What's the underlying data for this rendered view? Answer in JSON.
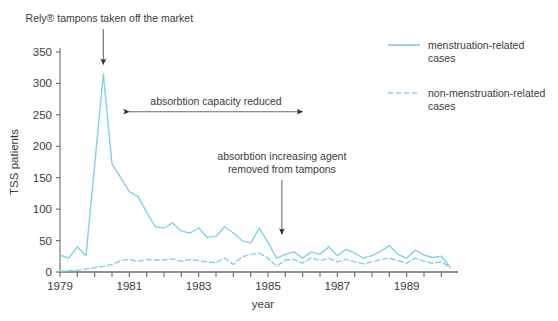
{
  "chart_data": {
    "type": "line",
    "title": "",
    "xlabel": "year",
    "ylabel": "TSS patients",
    "xlim": [
      1979.0,
      1990.25
    ],
    "ylim": [
      0,
      350
    ],
    "yticks": [
      0,
      50,
      100,
      150,
      200,
      250,
      300,
      350
    ],
    "ytick_labels": [
      "0",
      "50",
      "100",
      "150",
      "200",
      "250",
      "300",
      "350"
    ],
    "xticks": [
      1979,
      1979.5,
      1980,
      1980.5,
      1981,
      1981.5,
      1982,
      1982.5,
      1983,
      1983.5,
      1984,
      1984.5,
      1985,
      1985.5,
      1986,
      1986.5,
      1987,
      1987.5,
      1988,
      1988.5,
      1989,
      1989.5,
      1990
    ],
    "xtick_labels_shown": [
      "1979",
      "1981",
      "1983",
      "1985",
      "1987",
      "1989"
    ],
    "xtick_labels_values": [
      1979,
      1981,
      1983,
      1985,
      1987,
      1989
    ],
    "grid": false,
    "legend_position": "top-right",
    "x": [
      1979.0,
      1979.25,
      1979.5,
      1979.75,
      1980.0,
      1980.25,
      1980.5,
      1980.75,
      1981.0,
      1981.25,
      1981.5,
      1981.75,
      1982.0,
      1982.25,
      1982.5,
      1982.75,
      1983.0,
      1983.25,
      1983.5,
      1983.75,
      1984.0,
      1984.25,
      1984.5,
      1984.75,
      1985.0,
      1985.25,
      1985.5,
      1985.75,
      1986.0,
      1986.25,
      1986.5,
      1986.75,
      1987.0,
      1987.25,
      1987.5,
      1987.75,
      1988.0,
      1988.25,
      1988.5,
      1988.75,
      1989.0,
      1989.25,
      1989.5,
      1989.75,
      1990.0,
      1990.25
    ],
    "series": [
      {
        "name": "menstruation-related cases",
        "style": "solid",
        "color": "#7FD2E8",
        "values": [
          27,
          22,
          40,
          26,
          170,
          315,
          172,
          150,
          128,
          120,
          95,
          72,
          70,
          78,
          65,
          62,
          70,
          55,
          57,
          72,
          62,
          50,
          46,
          70,
          47,
          22,
          28,
          32,
          22,
          32,
          28,
          40,
          26,
          36,
          30,
          22,
          26,
          33,
          42,
          28,
          22,
          35,
          27,
          23,
          25,
          8
        ]
      },
      {
        "name": "non-menstruation-related cases",
        "style": "dashed",
        "color": "#7FD2E8",
        "values": [
          1,
          2,
          3,
          5,
          7,
          9,
          12,
          18,
          20,
          17,
          20,
          19,
          19,
          21,
          17,
          20,
          18,
          16,
          15,
          22,
          12,
          24,
          28,
          30,
          22,
          9,
          19,
          20,
          14,
          23,
          18,
          22,
          16,
          20,
          16,
          13,
          16,
          20,
          22,
          18,
          14,
          22,
          17,
          14,
          16,
          7
        ]
      }
    ],
    "annotations": [
      {
        "id": "rely-removed",
        "text": "Rely® tampons taken off the market",
        "arrow": "down",
        "target_x": 1980.25,
        "target_y": 330
      },
      {
        "id": "absorbtion-capacity-reduced",
        "text": "absorbtion capacity reduced",
        "arrow": "double",
        "from_x": 1981.0,
        "to_x": 1986.0,
        "y": 255
      },
      {
        "id": "absorbtion-agent-removed",
        "text_line1": "absorbtion increasing agent",
        "text_line2": "removed from tampons",
        "arrow": "down",
        "target_x": 1985.4,
        "target_y": 60
      }
    ]
  },
  "legend": {
    "items": [
      {
        "label_line1": "menstruation-related",
        "label_line2": "cases",
        "style": "solid",
        "color": "#7FD2E8"
      },
      {
        "label_line1": "non-menstruation-related",
        "label_line2": "cases",
        "style": "dashed",
        "color": "#7FD2E8"
      }
    ]
  },
  "axis": {
    "y_title": "TSS patients",
    "x_title": "year"
  },
  "colors": {
    "line": "#7FD2E8",
    "axis": "#6b6b6b",
    "text": "#3b3b3b",
    "background": "#ffffff"
  }
}
